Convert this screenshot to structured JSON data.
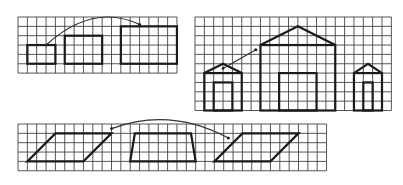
{
  "diagram": {
    "cell_size": 9.35,
    "colors": {
      "grid": "#444444",
      "shape": "#1a1a1a",
      "background": "#ffffff"
    },
    "panels": [
      {
        "id": "rectangles-panel",
        "origin": [
          18,
          17
        ],
        "cols": 17,
        "rows": 6,
        "shapes": [
          {
            "name": "small-rectangle",
            "type": "rect",
            "x": 1,
            "y": 3,
            "w": 3,
            "h": 2
          },
          {
            "name": "medium-rectangle",
            "type": "rect",
            "x": 5,
            "y": 2,
            "w": 4,
            "h": 3
          },
          {
            "name": "large-rectangle",
            "type": "rect",
            "x": 11,
            "y": 1,
            "w": 6,
            "h": 4
          }
        ],
        "arrow": {
          "name": "arc-arrow",
          "from": [
            3,
            3
          ],
          "to": [
            13,
            0.8
          ],
          "curved": true
        }
      },
      {
        "id": "houses-panel",
        "origin": [
          195,
          17
        ],
        "cols": 21,
        "rows": 10,
        "shapes": [
          {
            "name": "small-house",
            "wall": [
              1,
              6,
              4,
              4
            ],
            "peak": [
              3,
              5
            ],
            "door": [
              2,
              7,
              2,
              3
            ]
          },
          {
            "name": "large-house",
            "wall": [
              7,
              3,
              8,
              7
            ],
            "peak": [
              11,
              1
            ],
            "door": [
              9,
              6,
              4,
              4
            ]
          },
          {
            "name": "narrow-house",
            "wall": [
              17,
              6,
              3,
              4
            ],
            "peak": [
              18.5,
              5
            ],
            "door": [
              18,
              7,
              1,
              3
            ]
          }
        ],
        "arrow": {
          "name": "diagonal-arrow",
          "from": [
            3,
            5.5
          ],
          "to": [
            6.5,
            3.5
          ],
          "curved": false
        }
      },
      {
        "id": "parallelograms-panel",
        "origin": [
          18,
          124
        ],
        "cols": 33,
        "rows": 5,
        "shapes": [
          {
            "name": "parallelogram-left",
            "points": [
              [
                1,
                4
              ],
              [
                7,
                4
              ],
              [
                10,
                1
              ],
              [
                4,
                1
              ]
            ]
          },
          {
            "name": "parallelogram-middle",
            "points": [
              [
                12,
                4
              ],
              [
                19,
                4
              ],
              [
                18.5,
                1
              ],
              [
                12.5,
                1
              ]
            ]
          },
          {
            "name": "parallelogram-right",
            "points": [
              [
                21,
                4
              ],
              [
                27,
                4
              ],
              [
                30,
                1
              ],
              [
                24,
                1
              ]
            ]
          }
        ],
        "arrow": {
          "name": "double-arc-arrow",
          "from": [
            10,
            0.5
          ],
          "to": [
            22.5,
            1.5
          ],
          "curved": true
        }
      }
    ]
  }
}
